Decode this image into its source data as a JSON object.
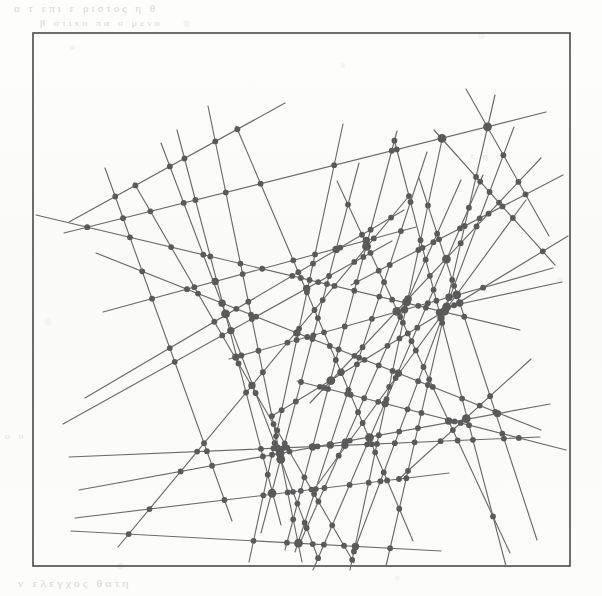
{
  "figure": {
    "kind": "line-arrangement-diagram",
    "caption_ghost_top_1": "α   τ   επι   ε   ριστος   η   θ",
    "caption_ghost_top_2": "β   στικο   πα   σ   μενο",
    "caption_ghost_right": "τ η ς",
    "caption_ghost_mid_left": "ο υ",
    "caption_ghost_bottom": "ν  ελεγχος   θατη",
    "frame": {
      "x": 33,
      "y": 33,
      "width": 537,
      "height": 533
    },
    "style": {
      "paper_color": "#fbfbfa",
      "frame_color": "#4a4a4a",
      "line_color": "#6b6b6b",
      "vertex_color": "#5a5a5a",
      "line_width": 1.15,
      "vertex_radius": 2.9,
      "hub_vertex_radius": 4.4
    },
    "counts": {
      "lines": 40,
      "vertices": 233
    },
    "lines": [
      [
        105,
        168,
        232,
        521
      ],
      [
        69,
        222,
        285,
        103
      ],
      [
        36,
        215,
        520,
        330
      ],
      [
        64,
        233,
        546,
        112
      ],
      [
        96,
        253,
        541,
        430
      ],
      [
        103,
        312,
        416,
        227
      ],
      [
        85,
        398,
        404,
        210
      ],
      [
        63,
        424,
        392,
        241
      ],
      [
        69,
        457,
        540,
        437
      ],
      [
        79,
        490,
        550,
        404
      ],
      [
        75,
        518,
        449,
        473
      ],
      [
        71,
        531,
        441,
        551
      ],
      [
        118,
        547,
        409,
        196
      ],
      [
        134,
        183,
        354,
        563
      ],
      [
        161,
        143,
        318,
        558
      ],
      [
        177,
        130,
        281,
        525
      ],
      [
        208,
        106,
        302,
        562
      ],
      [
        229,
        359,
        553,
        268
      ],
      [
        236,
        126,
        413,
        541
      ],
      [
        249,
        562,
        343,
        124
      ],
      [
        261,
        533,
        359,
        163
      ],
      [
        272,
        416,
        568,
        236
      ],
      [
        285,
        550,
        397,
        131
      ],
      [
        295,
        552,
        427,
        152
      ],
      [
        297,
        381,
        566,
        450
      ],
      [
        300,
        543,
        461,
        180
      ],
      [
        310,
        403,
        541,
        158
      ],
      [
        313,
        570,
        483,
        175
      ],
      [
        318,
        484,
        526,
        200
      ],
      [
        337,
        181,
        510,
        553
      ],
      [
        350,
        570,
        443,
        135
      ],
      [
        351,
        285,
        563,
        175
      ],
      [
        353,
        554,
        514,
        127
      ],
      [
        386,
        566,
        495,
        95
      ],
      [
        394,
        139,
        506,
        566
      ],
      [
        399,
        479,
        531,
        359
      ],
      [
        419,
        178,
        537,
        540
      ],
      [
        434,
        130,
        555,
        265
      ],
      [
        446,
        307,
        562,
        282
      ],
      [
        466,
        89,
        549,
        236
      ]
    ]
  }
}
